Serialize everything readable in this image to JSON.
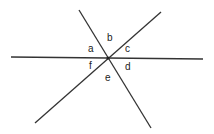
{
  "diagram": {
    "type": "intersecting-lines",
    "line_color": "#333333",
    "lines": [
      {
        "name": "horizontal-line",
        "x1": 11,
        "y1": 57,
        "x2": 203,
        "y2": 59
      },
      {
        "name": "steep-line",
        "x1": 79,
        "y1": 10,
        "x2": 151,
        "y2": 128
      },
      {
        "name": "rising-line",
        "x1": 35,
        "y1": 123,
        "x2": 161,
        "y2": 12
      }
    ],
    "intersection": {
      "x": 108,
      "y": 58
    },
    "angle_labels": [
      {
        "id": "a",
        "text": "a",
        "x": 88,
        "y": 44
      },
      {
        "id": "b",
        "text": "b",
        "x": 107,
        "y": 33
      },
      {
        "id": "c",
        "text": "c",
        "x": 125,
        "y": 44
      },
      {
        "id": "d",
        "text": "d",
        "x": 125,
        "y": 62
      },
      {
        "id": "e",
        "text": "e",
        "x": 105,
        "y": 73
      },
      {
        "id": "f",
        "text": "f",
        "x": 89,
        "y": 61
      }
    ]
  }
}
